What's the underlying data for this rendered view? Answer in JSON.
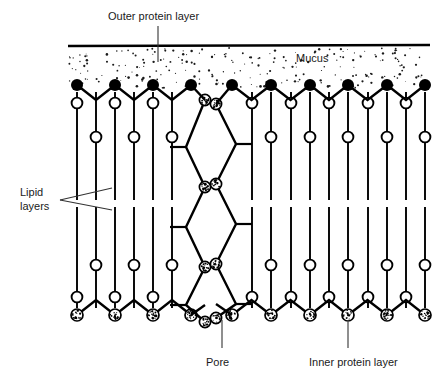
{
  "figure": {
    "type": "biological-membrane-cross-section",
    "background_color": "#ffffff",
    "ink_color": "#000000",
    "labels": {
      "outer_protein_layer": "Outer protein layer",
      "mucus": "Mucus",
      "lipid_layers_line1": "Lipid",
      "lipid_layers_line2": "layers",
      "pore": "Pore",
      "inner_protein_layer": "Inner protein layer"
    }
  },
  "geometry": {
    "surface_line": {
      "x1": 68,
      "y1": 46,
      "x2": 430,
      "y2": 45,
      "stroke_width": 2.6
    },
    "mucus_band": {
      "x": 68,
      "y": 48,
      "width": 362,
      "height": 40,
      "stipple_count": 230
    },
    "outer_heads": {
      "radius": 6.0,
      "fill": "solid-black",
      "y_peak": 85,
      "y_valley": 100,
      "left_group_x": [
        77,
        115,
        153,
        191
      ],
      "right_group_x": [
        232,
        271,
        310,
        348,
        387,
        425
      ]
    },
    "inner_heads": {
      "radius": 6.0,
      "fill": "stippled",
      "y_peak": 315,
      "y_valley": 300,
      "left_group_x": [
        77,
        115,
        153,
        191
      ],
      "right_group_x": [
        232,
        271,
        310,
        348,
        387,
        425
      ]
    },
    "upper_leaflet": {
      "tail_top_y": 92,
      "head_circle_radius": 5.4,
      "long_tail_head_y": 176,
      "short_tail_head_y": 143,
      "tail_bottom_y": 200,
      "columns": [
        {
          "x": 77,
          "variant": "short"
        },
        {
          "x": 96,
          "variant": "long"
        },
        {
          "x": 115,
          "variant": "short"
        },
        {
          "x": 134,
          "variant": "long"
        },
        {
          "x": 153,
          "variant": "short"
        },
        {
          "x": 172,
          "variant": "long"
        },
        {
          "x": 252,
          "variant": "short"
        },
        {
          "x": 271,
          "variant": "long"
        },
        {
          "x": 291,
          "variant": "short"
        },
        {
          "x": 310,
          "variant": "long"
        },
        {
          "x": 329,
          "variant": "short"
        },
        {
          "x": 348,
          "variant": "long"
        },
        {
          "x": 368,
          "variant": "short"
        },
        {
          "x": 387,
          "variant": "long"
        },
        {
          "x": 406,
          "variant": "short"
        },
        {
          "x": 425,
          "variant": "long"
        }
      ]
    },
    "lower_leaflet": {
      "tail_bottom_y": 308,
      "head_circle_radius": 5.4,
      "long_tail_head_y": 230,
      "short_tail_head_y": 263,
      "tail_top_y": 207,
      "columns": [
        {
          "x": 77,
          "variant": "short"
        },
        {
          "x": 96,
          "variant": "long"
        },
        {
          "x": 115,
          "variant": "short"
        },
        {
          "x": 134,
          "variant": "long"
        },
        {
          "x": 153,
          "variant": "short"
        },
        {
          "x": 172,
          "variant": "long"
        },
        {
          "x": 252,
          "variant": "short"
        },
        {
          "x": 271,
          "variant": "long"
        },
        {
          "x": 291,
          "variant": "short"
        },
        {
          "x": 310,
          "variant": "long"
        },
        {
          "x": 329,
          "variant": "short"
        },
        {
          "x": 348,
          "variant": "long"
        },
        {
          "x": 368,
          "variant": "short"
        },
        {
          "x": 387,
          "variant": "long"
        },
        {
          "x": 406,
          "variant": "short"
        },
        {
          "x": 425,
          "variant": "long"
        }
      ]
    },
    "pore": {
      "left_chain_x_outer": 186,
      "left_chain_x_inner": 205,
      "right_chain_x_inner": 216,
      "right_chain_x_outer": 236,
      "node_radius": 5.6,
      "node_fill": "stippled",
      "tick_length": 16,
      "left_nodes_y": [
        100,
        147,
        187,
        227,
        267,
        305,
        322
      ],
      "right_nodes_y": [
        104,
        144,
        184,
        224,
        264,
        304,
        318
      ]
    },
    "leaders": {
      "outer_protein": {
        "x": 158,
        "y1": 26,
        "y2": 62
      },
      "pore": {
        "x": 222,
        "y1": 320,
        "y2": 348
      },
      "inner_protein": {
        "x": 348,
        "y1": 322,
        "y2": 348
      },
      "lipid_upper": {
        "x1": 60,
        "y1": 200,
        "x2": 112,
        "y2": 188
      },
      "lipid_lower": {
        "x1": 60,
        "y1": 200,
        "x2": 112,
        "y2": 210
      }
    },
    "label_positions": {
      "outer_protein_layer": {
        "x": 108,
        "y": 20
      },
      "mucus": {
        "x": 296,
        "y": 62
      },
      "lipid_line1": {
        "x": 20,
        "y": 196
      },
      "lipid_line2": {
        "x": 20,
        "y": 210
      },
      "pore": {
        "x": 206,
        "y": 366
      },
      "inner_protein_layer": {
        "x": 309,
        "y": 366
      }
    }
  }
}
